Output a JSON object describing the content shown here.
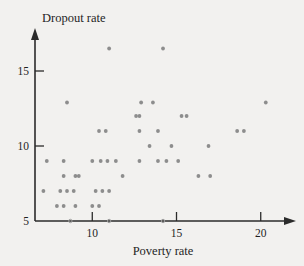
{
  "chart_data": {
    "type": "scatter",
    "title": "",
    "xlabel": "Poverty rate",
    "ylabel": "Dropout rate",
    "xlim": [
      6.6,
      21.5
    ],
    "ylim": [
      5.0,
      17.2
    ],
    "xticks": [
      10,
      15,
      20
    ],
    "yticks": [
      5,
      10,
      15
    ],
    "xtick_labels": [
      "10",
      "15",
      "20"
    ],
    "ytick_labels": [
      "5",
      "10",
      "15"
    ],
    "grid": false,
    "legend": null,
    "marker_color": "#8d8d8d",
    "axis_color": "#2b2b2b",
    "background_color": "#f2f1ef",
    "points": [
      [
        11.0,
        16.5
      ],
      [
        14.2,
        16.5
      ],
      [
        8.5,
        12.9
      ],
      [
        12.9,
        12.9
      ],
      [
        13.6,
        12.9
      ],
      [
        20.3,
        12.9
      ],
      [
        12.6,
        12.0
      ],
      [
        12.8,
        12.0
      ],
      [
        15.3,
        12.0
      ],
      [
        15.6,
        12.0
      ],
      [
        10.4,
        11.0
      ],
      [
        10.8,
        11.0
      ],
      [
        12.8,
        11.0
      ],
      [
        13.9,
        11.0
      ],
      [
        18.6,
        11.0
      ],
      [
        19.0,
        11.0
      ],
      [
        13.4,
        10.0
      ],
      [
        14.7,
        10.0
      ],
      [
        16.9,
        10.0
      ],
      [
        7.3,
        9.0
      ],
      [
        8.3,
        9.0
      ],
      [
        10.0,
        9.0
      ],
      [
        10.5,
        9.0
      ],
      [
        10.9,
        9.0
      ],
      [
        11.4,
        9.0
      ],
      [
        12.8,
        9.0
      ],
      [
        13.9,
        9.0
      ],
      [
        14.4,
        9.0
      ],
      [
        15.1,
        9.0
      ],
      [
        8.3,
        8.0
      ],
      [
        9.0,
        8.0
      ],
      [
        9.2,
        8.0
      ],
      [
        11.8,
        8.0
      ],
      [
        16.3,
        8.0
      ],
      [
        17.0,
        8.0
      ],
      [
        7.1,
        7.0
      ],
      [
        8.1,
        7.0
      ],
      [
        8.5,
        7.0
      ],
      [
        8.9,
        7.0
      ],
      [
        10.2,
        7.0
      ],
      [
        10.6,
        7.0
      ],
      [
        11.0,
        7.0
      ],
      [
        7.9,
        6.0
      ],
      [
        8.3,
        6.0
      ],
      [
        9.0,
        6.0
      ],
      [
        10.0,
        6.0
      ],
      [
        10.4,
        6.0
      ],
      [
        8.7,
        5.0
      ],
      [
        11.0,
        5.0
      ],
      [
        14.2,
        5.0
      ]
    ]
  }
}
